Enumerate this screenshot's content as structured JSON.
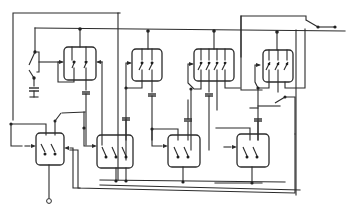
{
  "diagram": {
    "type": "relay-logic-schematic",
    "background": "#ffffff",
    "line_color": "#2b2b2b",
    "labels": [],
    "relays": [
      {
        "id": "R1",
        "contacts": 2,
        "position": "top-left"
      },
      {
        "id": "R2",
        "contacts": 2,
        "position": "top-center-left"
      },
      {
        "id": "R3",
        "contacts": 4,
        "position": "top-center-right"
      },
      {
        "id": "R4",
        "contacts": 3,
        "position": "top-right"
      },
      {
        "id": "R5",
        "contacts": 2,
        "position": "bottom-far-left"
      },
      {
        "id": "R6",
        "contacts": 3,
        "position": "bottom-left"
      },
      {
        "id": "R7",
        "contacts": 2,
        "position": "bottom-center"
      },
      {
        "id": "R8",
        "contacts": 2,
        "position": "bottom-right"
      }
    ],
    "capacitors": 7,
    "external_switches": 4,
    "output_terminal": 1
  }
}
